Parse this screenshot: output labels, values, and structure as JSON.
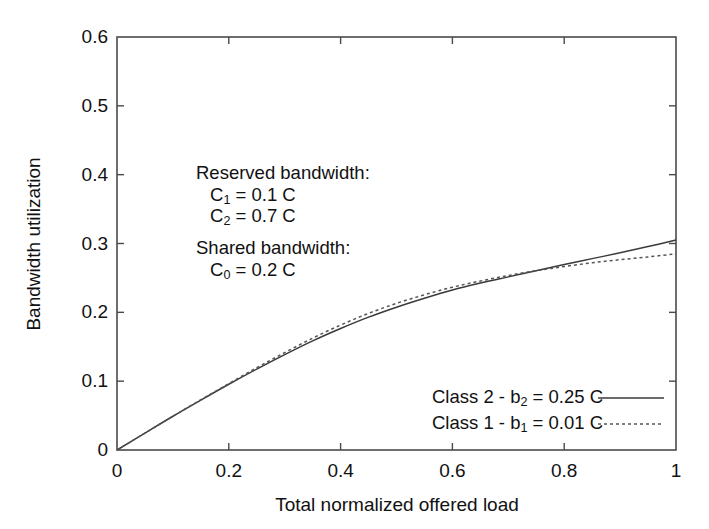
{
  "chart_data": {
    "type": "line",
    "title": "",
    "xlabel": "Total normalized offered load",
    "ylabel": "Bandwidth utilization",
    "xlim": [
      0,
      1
    ],
    "ylim": [
      0,
      0.6
    ],
    "xticks": [
      "0",
      "0.2",
      "0.4",
      "0.6",
      "0.8",
      "1"
    ],
    "xtick_values": [
      0,
      0.2,
      0.4,
      0.6,
      0.8,
      1
    ],
    "yticks": [
      "0",
      "0.1",
      "0.2",
      "0.3",
      "0.4",
      "0.5",
      "0.6"
    ],
    "ytick_values": [
      0,
      0.1,
      0.2,
      0.3,
      0.4,
      0.5,
      0.6
    ],
    "grid": false,
    "legend_position": "lower-right",
    "x": [
      0,
      0.05,
      0.1,
      0.15,
      0.2,
      0.25,
      0.3,
      0.35,
      0.4,
      0.45,
      0.5,
      0.55,
      0.6,
      0.65,
      0.7,
      0.75,
      0.8,
      0.85,
      0.9,
      0.95,
      1.0
    ],
    "series": [
      {
        "name": "Class 2 - b2 = 0.25 C",
        "style": "solid",
        "color": "#3a3a3a",
        "values": [
          0.0,
          0.0245,
          0.049,
          0.0725,
          0.0955,
          0.1175,
          0.1385,
          0.1585,
          0.1765,
          0.193,
          0.2075,
          0.2205,
          0.2325,
          0.2425,
          0.2515,
          0.2605,
          0.2695,
          0.278,
          0.2865,
          0.2955,
          0.305
        ]
      },
      {
        "name": "Class 1 - b1 = 0.01 C",
        "style": "dotted",
        "color": "#555555",
        "values": [
          0.0,
          0.0245,
          0.049,
          0.073,
          0.0965,
          0.1195,
          0.1415,
          0.1625,
          0.1815,
          0.1985,
          0.213,
          0.2255,
          0.2365,
          0.2455,
          0.2535,
          0.2605,
          0.2665,
          0.272,
          0.2765,
          0.2805,
          0.285
        ]
      }
    ],
    "annotations": [
      {
        "id": "reserved",
        "head": "Reserved bandwidth:",
        "lines": [
          {
            "sym": "C",
            "sub": "1",
            "rest": " = 0.1 C"
          },
          {
            "sym": "C",
            "sub": "2",
            "rest": " = 0.7 C"
          }
        ]
      },
      {
        "id": "shared",
        "head": "Shared bandwidth:",
        "lines": [
          {
            "sym": "C",
            "sub": "0",
            "rest": " = 0.2 C"
          }
        ]
      }
    ],
    "legend": [
      {
        "pre": "Class 2 - b",
        "sub": "2",
        "post": " = 0.25 C",
        "style": "solid"
      },
      {
        "pre": "Class 1 - b",
        "sub": "1",
        "post": " = 0.01 C",
        "style": "dotted"
      }
    ]
  }
}
